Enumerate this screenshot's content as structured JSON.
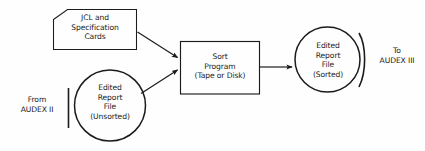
{
  "diagram": {
    "background_color": "#fefefe",
    "stroke_color": "#1b1b1b",
    "text_color": "#1b1b1b",
    "nodes": {
      "input_cards": {
        "shape": "punched-card",
        "lines": [
          "JCL and",
          "Specification",
          "Cards"
        ]
      },
      "process_sort": {
        "shape": "rectangle",
        "lines": [
          "Sort",
          "Program",
          "(Tape or Disk)"
        ]
      },
      "file_unsorted": {
        "shape": "circle",
        "lines": [
          "Edited",
          "Report",
          "File",
          "(Unsorted)"
        ]
      },
      "file_sorted": {
        "shape": "circle",
        "lines": [
          "Edited",
          "Report",
          "File",
          "(Sorted)"
        ]
      }
    },
    "annotations": {
      "source": {
        "lines": [
          "From",
          "AUDEX II"
        ]
      },
      "destination": {
        "lines": [
          "To",
          "AUDEX III"
        ]
      }
    },
    "connectors": [
      {
        "name": "cards-to-sort",
        "type": "arrow",
        "from": "input_cards",
        "to": "process_sort"
      },
      {
        "name": "unsorted-file-to-sort",
        "type": "arrow",
        "from": "file_unsorted",
        "to": "process_sort"
      },
      {
        "name": "sort-to-sorted-file",
        "type": "arrow",
        "from": "process_sort",
        "to": "file_sorted"
      }
    ]
  }
}
